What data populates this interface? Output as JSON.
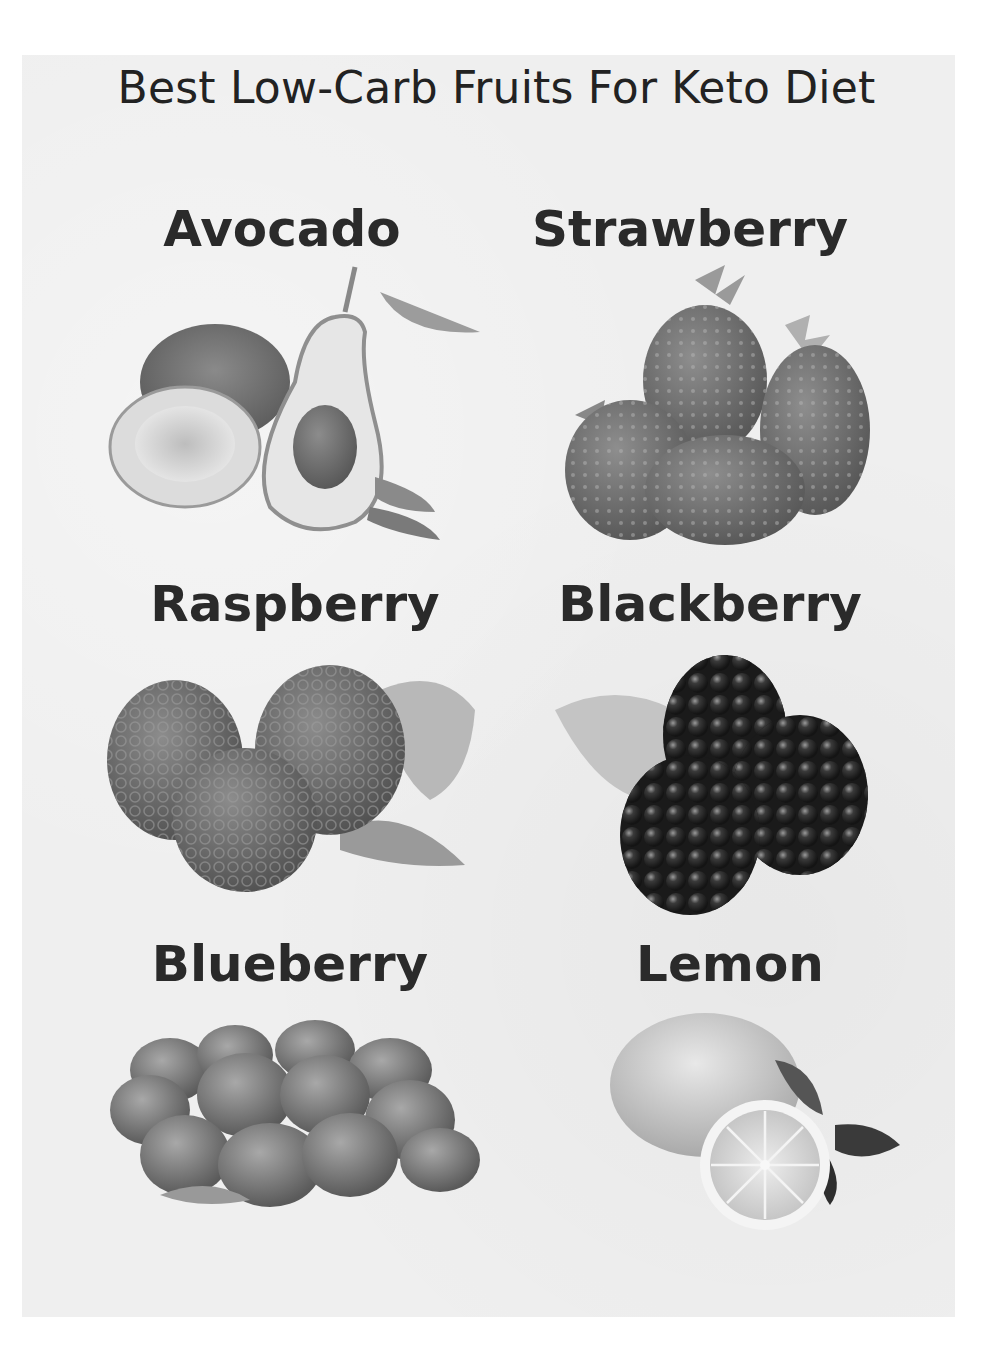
{
  "title": "Best Low-Carb Fruits For Keto Diet",
  "fruits": [
    {
      "name": "Avocado",
      "icon": "avocado-icon"
    },
    {
      "name": "Strawberry",
      "icon": "strawberry-icon"
    },
    {
      "name": "Raspberry",
      "icon": "raspberry-icon"
    },
    {
      "name": "Blackberry",
      "icon": "blackberry-icon"
    },
    {
      "name": "Blueberry",
      "icon": "blueberry-icon"
    },
    {
      "name": "Lemon",
      "icon": "lemon-icon"
    }
  ],
  "colors": {
    "page_background": "#ffffff",
    "card_background": "#efefef",
    "text": "#222222"
  }
}
